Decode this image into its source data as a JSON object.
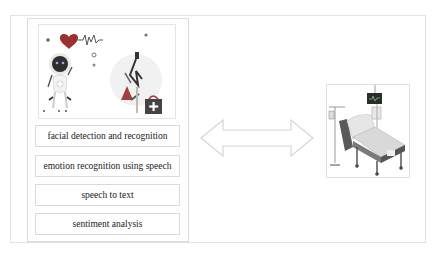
{
  "diagram": {
    "left_panel": {
      "illustration": {
        "description": "robot doctor with heartbeat heart icon and doctor with medical kit",
        "icons": [
          "heart-pulse-icon",
          "robot-icon",
          "doctor-icon",
          "medical-kit-icon"
        ]
      },
      "tasks": [
        {
          "label": "facial detection and recognition"
        },
        {
          "label": "emotion recognition using speech"
        },
        {
          "label": "speech to text"
        },
        {
          "label": "sentiment analysis"
        }
      ]
    },
    "connector": {
      "type": "double-headed-arrow",
      "color": "#d8d8d8"
    },
    "right_panel": {
      "illustration": {
        "description": "hospital bed with IV stand and monitor",
        "icons": [
          "hospital-bed-icon",
          "iv-drip-icon",
          "monitor-icon"
        ]
      }
    }
  },
  "colors": {
    "border": "#dcdcdc",
    "text": "#222222",
    "accent_dark": "#4a4a4a",
    "accent_red": "#b03a3a"
  }
}
